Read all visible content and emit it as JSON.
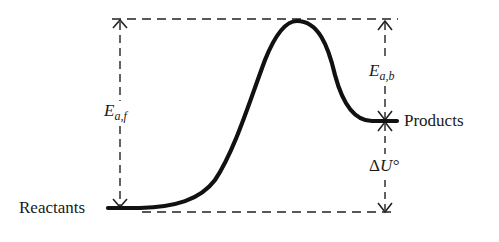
{
  "diagram": {
    "title": "",
    "type": "energy-profile",
    "labels": {
      "reactants": "Reactants",
      "products": "Products",
      "ea_forward_main": "E",
      "ea_forward_sub": "a,f",
      "ea_backward_main": "E",
      "ea_backward_sub": "a,b",
      "delta_symbol": "Δ",
      "delta_u": "U°"
    },
    "colors": {
      "curve": "#111111",
      "dashes": "#222222",
      "text": "#1a1a1a",
      "background": "#ffffff"
    },
    "levels": {
      "reactants_y": 208,
      "products_y": 121,
      "transition_state_y": 19
    },
    "annotations": [
      {
        "name": "activation-energy-forward",
        "from": "reactants",
        "to": "transition-state"
      },
      {
        "name": "activation-energy-backward",
        "from": "products",
        "to": "transition-state"
      },
      {
        "name": "internal-energy-change",
        "from": "reactants",
        "to": "products"
      }
    ]
  }
}
